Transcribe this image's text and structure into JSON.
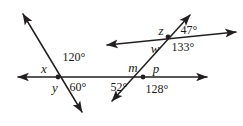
{
  "figure": {
    "background_color": "#ffffff",
    "stroke_color": "#231f20",
    "text_color": "#1a1a1a",
    "width": 243,
    "height": 126
  },
  "lines": [
    {
      "name": "horizontal-line",
      "x1": 18,
      "y1": 77,
      "x2": 207,
      "y2": 77,
      "arrow_start": true,
      "arrow_end": true
    },
    {
      "name": "left-transversal",
      "x1": 23,
      "y1": 14,
      "x2": 82,
      "y2": 112,
      "arrow_start": true,
      "arrow_end": true
    },
    {
      "name": "right-transversal",
      "x1": 190,
      "y1": 15,
      "x2": 112,
      "y2": 101,
      "arrow_start": true,
      "arrow_end": true
    },
    {
      "name": "slanted-line",
      "x1": 107,
      "y1": 45,
      "x2": 236,
      "y2": 32,
      "arrow_start": true,
      "arrow_end": true
    }
  ],
  "intersections": [
    {
      "name": "left-intersection",
      "x": 58,
      "y": 77
    },
    {
      "name": "middle-intersection",
      "x": 143,
      "y": 77
    },
    {
      "name": "upper-right-intersection",
      "x": 168,
      "y": 37
    }
  ],
  "labels": {
    "variables": [
      {
        "name": "angle-label-x",
        "text": "x",
        "x": 44,
        "y": 68
      },
      {
        "name": "angle-label-y",
        "text": "y",
        "x": 55,
        "y": 87
      },
      {
        "name": "angle-label-m",
        "text": "m",
        "x": 133,
        "y": 67
      },
      {
        "name": "angle-label-p",
        "text": "p",
        "x": 156,
        "y": 68
      },
      {
        "name": "angle-label-z",
        "text": "z",
        "x": 161,
        "y": 30
      },
      {
        "name": "angle-label-w",
        "text": "w",
        "x": 155,
        "y": 48
      }
    ],
    "angles": [
      {
        "name": "angle-value-120",
        "text": "120°",
        "x": 74,
        "y": 57
      },
      {
        "name": "angle-value-60",
        "text": "60°",
        "x": 78,
        "y": 87
      },
      {
        "name": "angle-value-52",
        "text": "52°",
        "x": 119,
        "y": 87
      },
      {
        "name": "angle-value-128",
        "text": "128°",
        "x": 157,
        "y": 89
      },
      {
        "name": "angle-value-47",
        "text": "47°",
        "x": 189,
        "y": 30
      },
      {
        "name": "angle-value-133",
        "text": "133°",
        "x": 183,
        "y": 47
      }
    ]
  }
}
